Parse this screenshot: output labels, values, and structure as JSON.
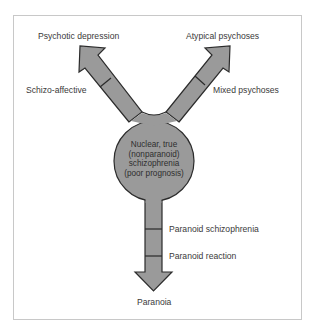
{
  "diagram": {
    "title": "",
    "center": {
      "lines": [
        "Nuclear, true",
        "(nonparanoid)",
        "schizophrenia",
        "(poor prognosis)"
      ]
    },
    "branches": {
      "upper_left": {
        "near_label": "Schizo-affective",
        "end_label": "Psychotic depression"
      },
      "upper_right": {
        "near_label": "Mixed psychoses",
        "end_label": "Atypical psychoses"
      },
      "down": {
        "segment_labels": [
          "Paranoid schizophrenia",
          "Paranoid reaction"
        ],
        "end_label": "Paranoia"
      }
    },
    "colors": {
      "shape_fill": "#9a9a9a",
      "shape_stroke": "#2b2b2b",
      "frame_border": "#c8c8c8",
      "text": "#3a3a3a"
    }
  }
}
